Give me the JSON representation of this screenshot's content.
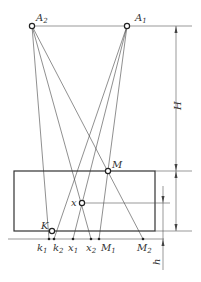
{
  "diagram": {
    "title": "",
    "points": {
      "A2": {
        "label": "A",
        "sub": "2"
      },
      "A1": {
        "label": "A",
        "sub": "1"
      },
      "M": {
        "label": "M"
      },
      "x": {
        "label": "x"
      },
      "K": {
        "label": "K"
      }
    },
    "ground_marks": [
      {
        "label": "k",
        "sub": "1"
      },
      {
        "label": "k",
        "sub": "2"
      },
      {
        "label": "x",
        "sub": "1"
      },
      {
        "label": "x",
        "sub": "2"
      },
      {
        "label": "M",
        "sub": "1"
      },
      {
        "label": "M",
        "sub": "2"
      }
    ],
    "dimensions": {
      "H": "H",
      "h": "h"
    }
  }
}
